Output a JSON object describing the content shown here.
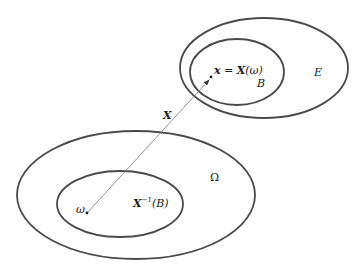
{
  "diagram": {
    "sets": [
      {
        "id": "E",
        "label": "E",
        "cx": 264,
        "cy": 68,
        "rx": 84,
        "ry": 50
      },
      {
        "id": "B",
        "label": "B",
        "cx": 237,
        "cy": 72,
        "rx": 47,
        "ry": 33
      },
      {
        "id": "Omega",
        "label": "Ω",
        "cx": 136,
        "cy": 195,
        "rx": 119,
        "ry": 64
      },
      {
        "id": "preimage",
        "label": "X⁻¹(B)",
        "cx": 120,
        "cy": 204,
        "rx": 63,
        "ry": 33
      }
    ],
    "points": {
      "omega": {
        "label": "ω",
        "x": 87,
        "y": 213
      },
      "x": {
        "label": "x = X(ω)",
        "x": 211,
        "y": 77
      }
    },
    "mapping": {
      "label": "X"
    },
    "labels": {
      "E": "E",
      "B": "B",
      "Omega": "Ω",
      "preimage_main": "X",
      "preimage_sup": "−1",
      "preimage_arg": "(B)",
      "omega": "ω",
      "x_var": "x",
      "x_eq": " = ",
      "x_func": "X",
      "x_arg": "(ω)",
      "map": "X"
    },
    "colors": {
      "stroke": "#4a4a4a",
      "arrow": "#6a6a6a",
      "text": "#222222"
    }
  }
}
